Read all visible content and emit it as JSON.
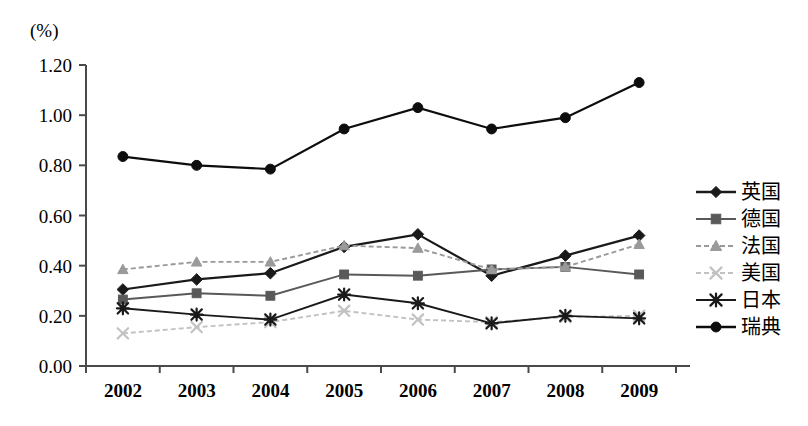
{
  "chart_data": {
    "type": "line",
    "title": "",
    "subtitle": "",
    "unit_label": "(%)",
    "xlabel": "",
    "ylabel": "",
    "x": [
      "2002",
      "2003",
      "2004",
      "2005",
      "2006",
      "2007",
      "2008",
      "2009"
    ],
    "categories": [
      "2002",
      "2003",
      "2004",
      "2005",
      "2006",
      "2007",
      "2008",
      "2009"
    ],
    "ylim": [
      0.0,
      1.2
    ],
    "yticks": [
      "0.00",
      "0.20",
      "0.40",
      "0.60",
      "0.80",
      "1.00",
      "1.20"
    ],
    "ytick_values": [
      0.0,
      0.2,
      0.4,
      0.6,
      0.8,
      1.0,
      1.2
    ],
    "grid": false,
    "legend_position": "right",
    "series": [
      {
        "name": "英国",
        "marker": "diamond",
        "color": "#1a1a1a",
        "linestyle": "solid",
        "values": [
          0.305,
          0.345,
          0.37,
          0.475,
          0.525,
          0.36,
          0.44,
          0.52
        ]
      },
      {
        "name": "德国",
        "marker": "square",
        "color": "#595959",
        "linestyle": "solid",
        "values": [
          0.265,
          0.29,
          0.28,
          0.365,
          0.36,
          0.385,
          0.395,
          0.365
        ]
      },
      {
        "name": "法国",
        "marker": "triangle",
        "color": "#9a9a9a",
        "linestyle": "dashed",
        "values": [
          0.385,
          0.415,
          0.415,
          0.48,
          0.47,
          0.385,
          0.395,
          0.485
        ]
      },
      {
        "name": "美国",
        "marker": "x",
        "color": "#c2c2c2",
        "linestyle": "dashed",
        "values": [
          0.13,
          0.155,
          0.175,
          0.22,
          0.185,
          0.175,
          0.195,
          0.2
        ]
      },
      {
        "name": "日本",
        "marker": "asterisk",
        "color": "#1a1a1a",
        "linestyle": "solid",
        "values": [
          0.23,
          0.205,
          0.185,
          0.285,
          0.25,
          0.17,
          0.2,
          0.19
        ]
      },
      {
        "name": "瑞典",
        "marker": "circle",
        "color": "#0d0d0d",
        "linestyle": "solid",
        "values": [
          0.835,
          0.8,
          0.785,
          0.945,
          1.03,
          0.945,
          0.99,
          1.13
        ]
      }
    ]
  },
  "legend": {
    "items": [
      {
        "label": "英国",
        "marker": "diamond",
        "color": "#1a1a1a",
        "linestyle": "solid"
      },
      {
        "label": "德国",
        "marker": "square",
        "color": "#595959",
        "linestyle": "solid"
      },
      {
        "label": "法国",
        "marker": "triangle",
        "color": "#9a9a9a",
        "linestyle": "dashed"
      },
      {
        "label": "美国",
        "marker": "x",
        "color": "#c2c2c2",
        "linestyle": "dashed"
      },
      {
        "label": "日本",
        "marker": "asterisk",
        "color": "#1a1a1a",
        "linestyle": "solid"
      },
      {
        "label": "瑞典",
        "marker": "circle",
        "color": "#0d0d0d",
        "linestyle": "solid"
      }
    ]
  },
  "axes": {
    "unit_label": "(%)",
    "axis_color": "#4a4a4a"
  }
}
